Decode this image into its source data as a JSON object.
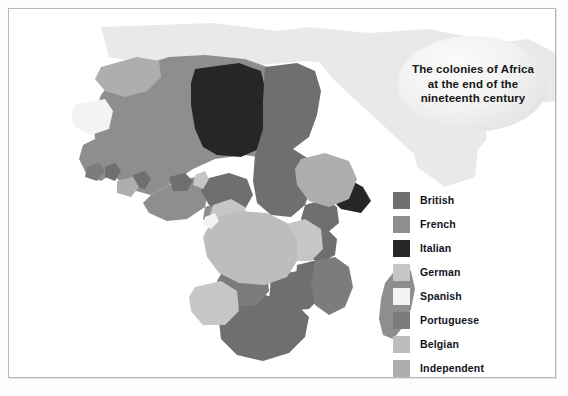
{
  "figure": {
    "kind": "historical-thematic-map",
    "region": "Africa",
    "background_color": "#ffffff",
    "frame_color": "#b9b9b9"
  },
  "title": {
    "text": "The colonies of Africa at the end of the nineteenth century",
    "line1": "The colonies of",
    "line2": "Africa at the end",
    "line3": "of the nineteenth",
    "line4": "century",
    "shape": "ellipse",
    "fill": "#ededed",
    "text_color": "#161616"
  },
  "legend": {
    "title": "",
    "entries": [
      {
        "label": "British",
        "color": "#6f6f6f"
      },
      {
        "label": "French",
        "color": "#8e8e8e"
      },
      {
        "label": "Italian",
        "color": "#262626"
      },
      {
        "label": "German",
        "color": "#c6c6c6"
      },
      {
        "label": "Spanish",
        "color": "#f3f3f3"
      },
      {
        "label": "Portuguese",
        "color": "#7c7c7c"
      },
      {
        "label": "Belgian",
        "color": "#bdbdbd"
      },
      {
        "label": "Independent",
        "color": "#aeaeae"
      }
    ]
  },
  "map_data": {
    "type": "choropleth",
    "color_scale": "grayscale",
    "ocean_color": "#ffffff",
    "off_continent_color": "#eaeaea",
    "territories": [
      {
        "name": "Morocco",
        "power": "Independent"
      },
      {
        "name": "Rio de Oro",
        "power": "Spanish"
      },
      {
        "name": "Algeria",
        "power": "French"
      },
      {
        "name": "Tunisia",
        "power": "French"
      },
      {
        "name": "Libya",
        "power": "Italian"
      },
      {
        "name": "Egypt",
        "power": "British"
      },
      {
        "name": "Anglo-Egyptian Sudan",
        "power": "British"
      },
      {
        "name": "French West Africa",
        "power": "French"
      },
      {
        "name": "Senegal",
        "power": "French"
      },
      {
        "name": "Gambia",
        "power": "British"
      },
      {
        "name": "Portuguese Guinea",
        "power": "Portuguese"
      },
      {
        "name": "Sierra Leone",
        "power": "British"
      },
      {
        "name": "Liberia",
        "power": "Independent"
      },
      {
        "name": "Gold Coast",
        "power": "British"
      },
      {
        "name": "Togoland",
        "power": "German"
      },
      {
        "name": "Dahomey",
        "power": "French"
      },
      {
        "name": "Nigeria",
        "power": "British"
      },
      {
        "name": "Kamerun",
        "power": "German"
      },
      {
        "name": "Rio Muni",
        "power": "Spanish"
      },
      {
        "name": "French Equatorial Africa",
        "power": "French"
      },
      {
        "name": "Belgian Congo",
        "power": "Belgian"
      },
      {
        "name": "Angola",
        "power": "Portuguese"
      },
      {
        "name": "Abyssinia",
        "power": "Independent"
      },
      {
        "name": "Eritrea",
        "power": "Italian"
      },
      {
        "name": "Italian Somaliland",
        "power": "Italian"
      },
      {
        "name": "British Somaliland",
        "power": "British"
      },
      {
        "name": "French Somaliland",
        "power": "French"
      },
      {
        "name": "British East Africa",
        "power": "British"
      },
      {
        "name": "Uganda",
        "power": "British"
      },
      {
        "name": "German East Africa",
        "power": "German"
      },
      {
        "name": "Northern Rhodesia",
        "power": "British"
      },
      {
        "name": "Southern Rhodesia",
        "power": "British"
      },
      {
        "name": "Nyasaland",
        "power": "British"
      },
      {
        "name": "Mozambique",
        "power": "Portuguese"
      },
      {
        "name": "German South West Africa",
        "power": "German"
      },
      {
        "name": "Bechuanaland",
        "power": "British"
      },
      {
        "name": "South Africa",
        "power": "British"
      },
      {
        "name": "Madagascar",
        "power": "French"
      }
    ]
  }
}
